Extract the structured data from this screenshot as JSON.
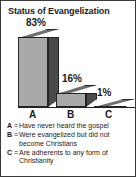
{
  "card": {
    "title": "Status of Evangelization",
    "border_color": "#3a3a3a",
    "background": "#ffffff"
  },
  "chart_data": {
    "type": "bar",
    "title": "Status of Evangelization",
    "categories": [
      "A",
      "B",
      "C"
    ],
    "values": [
      83,
      16,
      1
    ],
    "value_labels": [
      "83%",
      "16%",
      "1%"
    ],
    "xlabel": "",
    "ylabel": "",
    "ylim": [
      0,
      100
    ],
    "grid": false,
    "legend_position": "below",
    "style": "3d-bar",
    "colors": {
      "bar_front": "#a9a9a9",
      "bar_side": "#4a4a4a",
      "bar_top": "#6e6e6e",
      "outline": "#222222",
      "text": "#1b1b1b"
    },
    "legend": [
      {
        "key": "A",
        "equals": "=",
        "description": "Have never heard the gospel"
      },
      {
        "key": "B",
        "equals": "=",
        "description": "Were evangelized but did not become Christians"
      },
      {
        "key": "C",
        "equals": "=",
        "description": "Are adherents to any form of Christianity"
      }
    ]
  }
}
